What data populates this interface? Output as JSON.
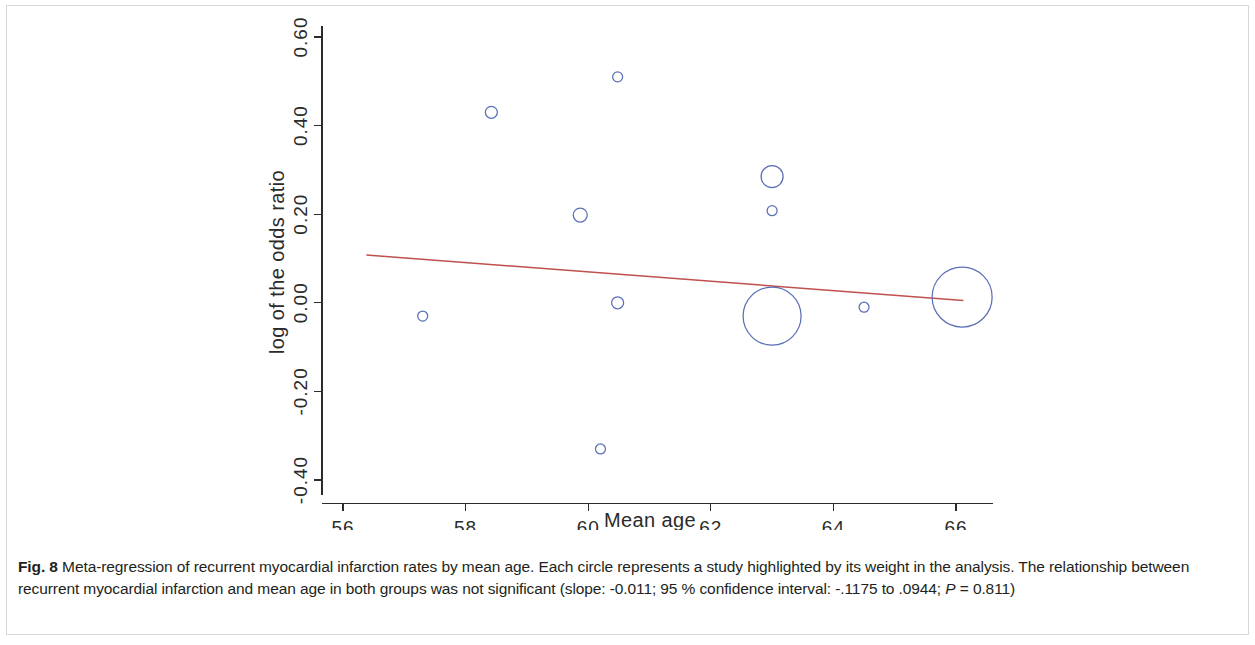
{
  "figure": {
    "label": "Fig. 8",
    "caption_part1": " Meta-regression of recurrent myocardial infarction rates by mean age. Each circle represents a study highlighted by its weight in the analysis. The relationship between recurrent myocardial infarction and mean age in both groups was not significant (slope: -0.011; 95 % confidence interval: -.1175 to .0944; ",
    "caption_italic": "P",
    "caption_part2": " = 0.811)"
  },
  "chart_data": {
    "type": "scatter",
    "title": "",
    "xlabel": "Mean age",
    "ylabel": "log of the odds ratio",
    "xlim": [
      55.9,
      66.6
    ],
    "ylim": [
      -0.43,
      0.62
    ],
    "xticks": [
      56,
      58,
      60,
      62,
      64,
      66
    ],
    "xtick_labels": [
      "56",
      "58",
      "60",
      "62",
      "64",
      "66"
    ],
    "yticks": [
      0.6,
      0.4,
      0.2,
      0.0,
      -0.2,
      -0.4
    ],
    "ytick_labels": [
      "0.60",
      "0.40",
      "0.20",
      "0.00",
      "-0.20",
      "-0.40"
    ],
    "grid": false,
    "legend": "none",
    "bubble_color": "#5b6fb5",
    "line_color": "#c0504d",
    "points": [
      {
        "x": 57.3,
        "y": -0.03,
        "weight": 5
      },
      {
        "x": 58.42,
        "y": 0.43,
        "weight": 6
      },
      {
        "x": 59.87,
        "y": 0.198,
        "weight": 7
      },
      {
        "x": 60.48,
        "y": 0.51,
        "weight": 5
      },
      {
        "x": 60.48,
        "y": 0.0,
        "weight": 6
      },
      {
        "x": 60.2,
        "y": -0.33,
        "weight": 5
      },
      {
        "x": 63.0,
        "y": 0.285,
        "weight": 11
      },
      {
        "x": 63.0,
        "y": 0.208,
        "weight": 5
      },
      {
        "x": 63.0,
        "y": -0.03,
        "weight": 29
      },
      {
        "x": 64.5,
        "y": -0.01,
        "weight": 5
      },
      {
        "x": 66.1,
        "y": 0.013,
        "weight": 30
      }
    ],
    "regression": {
      "slope": -0.011,
      "ci_low": -0.1175,
      "ci_high": 0.0944,
      "p_value": 0.811,
      "x_start": 56.38,
      "y_start": 0.108,
      "x_end": 66.12,
      "y_end": 0.005
    }
  }
}
